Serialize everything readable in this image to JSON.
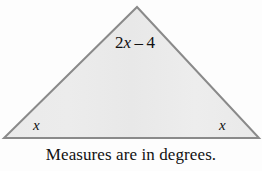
{
  "figure": {
    "type": "isosceles-triangle-angle-diagram",
    "caption": "Measures are in degrees.",
    "fill_color": "#e9e9e9",
    "stroke_color": "#8a8a8a",
    "background_color": "#fdfdfd",
    "text_color": "#111111"
  },
  "triangle": {
    "apex": {
      "x": 137,
      "y": 7
    },
    "bottom_left": {
      "x": 4,
      "y": 138
    },
    "bottom_right": {
      "x": 259,
      "y": 138
    },
    "stroke_width": 2
  },
  "labels": {
    "apex_angle": {
      "full_text": "2x – 4",
      "coefficient": "2",
      "variable": "x",
      "operator": "–",
      "constant": "4"
    },
    "base_angle_left": "x",
    "base_angle_right": "x"
  }
}
